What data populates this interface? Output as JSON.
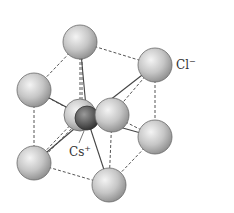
{
  "diagram": {
    "labels": {
      "anion": "Cl",
      "anion_charge": "−",
      "cation": "Cs",
      "cation_charge": "+"
    },
    "colors": {
      "anion_fill": "#c8c8c8",
      "cation_fill": "#5a5a5a",
      "edge": "#555555"
    },
    "anions": [
      {
        "id": "top",
        "cx": 80,
        "cy": 42
      },
      {
        "id": "right-upper",
        "cx": 155,
        "cy": 65
      },
      {
        "id": "left-upper",
        "cx": 34,
        "cy": 90
      },
      {
        "id": "back-center",
        "cx": 80,
        "cy": 115
      },
      {
        "id": "front-center",
        "cx": 112,
        "cy": 115
      },
      {
        "id": "right-lower",
        "cx": 155,
        "cy": 137
      },
      {
        "id": "left-lower",
        "cx": 34,
        "cy": 163
      },
      {
        "id": "bottom",
        "cx": 109,
        "cy": 185
      }
    ],
    "cation": {
      "cx": 87,
      "cy": 118
    }
  }
}
